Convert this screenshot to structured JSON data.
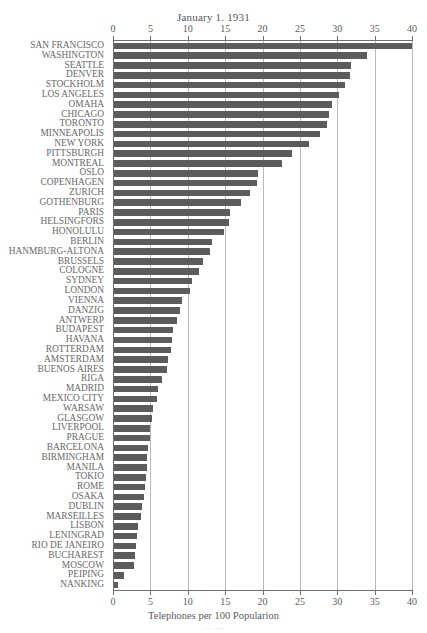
{
  "chart_data": {
    "type": "bar",
    "orientation": "horizontal",
    "title": "January 1. 1931",
    "xlabel": "Telephones per 100 Popularion",
    "ylabel": "",
    "xlim": [
      0,
      40
    ],
    "xticks": [
      0,
      5,
      10,
      15,
      20,
      25,
      30,
      35,
      40
    ],
    "grid": true,
    "grid_axis": "x",
    "legend": null,
    "bar_color": "#5c5c5c",
    "categories": [
      "SAN FRANCISCO",
      "WASHINGTON",
      "SEATTLE",
      "DENVER",
      "STOCKHOLM",
      "LOS ANGELES",
      "OMAHA",
      "CHICAGO",
      "TORONTO",
      "MINNEAPOLIS",
      "NEW YORK",
      "PITTSBURGH",
      "MONTREAL",
      "OSLO",
      "COPENHAGEN",
      "ZURICH",
      "GOTHENBURG",
      "PARIS",
      "HELSINGFORS",
      "HONOLULU",
      "BERLIN",
      "HANMBURG-ALTONA",
      "BRUSSELS",
      "COLOGNE",
      "SYDNEY",
      "LONDON",
      "VIENNA",
      "DANZIG",
      "ANTWERP",
      "BUDAPEST",
      "HAVANA",
      "ROTTERDAM",
      "AMSTERDAM",
      "BUENOS AIRES",
      "RIGA",
      "MADRID",
      "MEXICO CITY",
      "WARSAW",
      "GLASGOW",
      "LIVERPOOL",
      "PRAGUE",
      "BARCELONA",
      "BIRMINGHAM",
      "MANILA",
      "TOKIO",
      "ROME",
      "OSAKA",
      "DUBLIN",
      "MARSEILLES",
      "LISBON",
      "LENINGRAD",
      "RIO DE JANEIRO",
      "BUCHAREST",
      "MOSCOW",
      "PEIPING",
      "NANKING"
    ],
    "values": [
      40.0,
      34.0,
      31.8,
      31.7,
      31.0,
      30.2,
      29.3,
      28.9,
      28.6,
      27.7,
      26.2,
      24.0,
      22.6,
      19.4,
      19.2,
      18.3,
      17.1,
      15.6,
      15.5,
      14.9,
      13.3,
      13.0,
      12.0,
      11.5,
      10.6,
      10.3,
      9.2,
      9.0,
      8.6,
      8.0,
      7.9,
      7.7,
      7.3,
      7.2,
      6.5,
      6.0,
      5.9,
      5.4,
      5.2,
      5.0,
      4.9,
      4.7,
      4.6,
      4.5,
      4.4,
      4.3,
      4.1,
      3.9,
      3.8,
      3.4,
      3.2,
      3.1,
      2.9,
      2.8,
      1.5,
      0.7
    ]
  },
  "footer": {
    "mark": "–– ––"
  }
}
